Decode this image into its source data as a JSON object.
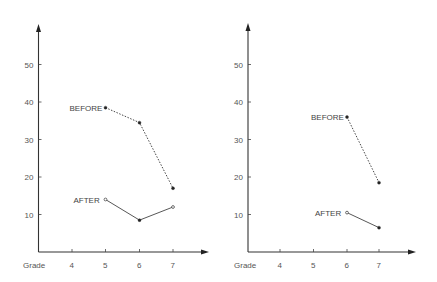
{
  "chart_data": [
    {
      "type": "line",
      "title": "",
      "xlabel": "Grade",
      "ylabel": "",
      "x_ticks": [
        "4",
        "5",
        "6",
        "7"
      ],
      "y_ticks": [
        "10",
        "20",
        "30",
        "40",
        "50"
      ],
      "ylim": [
        0,
        60
      ],
      "grid": false,
      "legend": "inline labels",
      "series": [
        {
          "name": "BEFORE",
          "style": "dotted",
          "x": [
            5,
            6,
            7
          ],
          "values": [
            38.5,
            34.5,
            17
          ]
        },
        {
          "name": "AFTER",
          "style": "solid",
          "x": [
            5,
            6,
            7
          ],
          "values": [
            14,
            8.5,
            12
          ]
        }
      ]
    },
    {
      "type": "line",
      "title": "",
      "xlabel": "Grade",
      "ylabel": "",
      "x_ticks": [
        "4",
        "5",
        "6",
        "7"
      ],
      "y_ticks": [
        "10",
        "20",
        "30",
        "40",
        "50"
      ],
      "ylim": [
        0,
        60
      ],
      "grid": false,
      "legend": "inline labels",
      "series": [
        {
          "name": "BEFORE",
          "style": "dotted",
          "x": [
            6,
            7
          ],
          "values": [
            36,
            18.5
          ]
        },
        {
          "name": "AFTER",
          "style": "solid",
          "x": [
            6,
            7
          ],
          "values": [
            10.5,
            6.5
          ]
        }
      ]
    }
  ],
  "colors": {
    "ink": "#333333",
    "label": "#555555",
    "background": "#ffffff"
  }
}
